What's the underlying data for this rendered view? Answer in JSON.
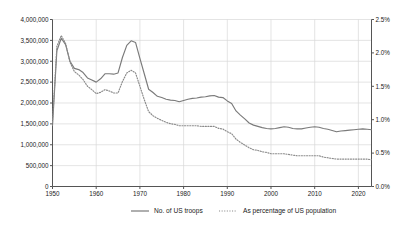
{
  "chart_data": {
    "type": "line",
    "title": "",
    "subtitle": "",
    "xlabel": "",
    "ylabel": "",
    "y2label": "",
    "xlim": [
      1950,
      2023
    ],
    "ylim": [
      0,
      4000000
    ],
    "y2lim": [
      0,
      0.025
    ],
    "grid": true,
    "legend_position": "bottom",
    "x_ticks": [
      "1950",
      "1960",
      "1970",
      "1980",
      "1990",
      "2000",
      "2010",
      "2020"
    ],
    "x_tick_values": [
      1950,
      1960,
      1970,
      1980,
      1990,
      2000,
      2010,
      2020
    ],
    "y_ticks": [
      "0",
      "500,000",
      "1,000,000",
      "1,500,000",
      "2,000,000",
      "2,500,000",
      "3,000,000",
      "3,500,000",
      "4,000,000"
    ],
    "y_tick_values": [
      0,
      500000,
      1000000,
      1500000,
      2000000,
      2500000,
      3000000,
      3500000,
      4000000
    ],
    "y2_ticks": [
      "0.0%",
      "0.5%",
      "1.0%",
      "1.5%",
      "2.0%",
      "2.5%"
    ],
    "y2_tick_values": [
      0,
      0.005,
      0.01,
      0.015,
      0.02,
      0.025
    ],
    "x": [
      1950,
      1951,
      1952,
      1953,
      1954,
      1955,
      1956,
      1957,
      1958,
      1959,
      1960,
      1961,
      1962,
      1963,
      1964,
      1965,
      1966,
      1967,
      1968,
      1969,
      1970,
      1971,
      1972,
      1973,
      1974,
      1975,
      1976,
      1977,
      1978,
      1979,
      1980,
      1981,
      1982,
      1983,
      1984,
      1985,
      1986,
      1987,
      1988,
      1989,
      1990,
      1991,
      1992,
      1993,
      1994,
      1995,
      1996,
      1997,
      1998,
      1999,
      2000,
      2001,
      2002,
      2003,
      2004,
      2005,
      2006,
      2007,
      2008,
      2009,
      2010,
      2011,
      2012,
      2013,
      2014,
      2015,
      2016,
      2017,
      2018,
      2019,
      2020,
      2021,
      2022,
      2023
    ],
    "series": [
      {
        "name": "No. of US troops",
        "axis": "left",
        "style": "solid",
        "color": "#7a7a7a",
        "values": [
          1460000,
          3250000,
          3550000,
          3400000,
          3000000,
          2830000,
          2800000,
          2730000,
          2600000,
          2550000,
          2500000,
          2580000,
          2700000,
          2700000,
          2690000,
          2720000,
          3090000,
          3380000,
          3490000,
          3450000,
          3070000,
          2700000,
          2330000,
          2250000,
          2160000,
          2130000,
          2090000,
          2070000,
          2060000,
          2030000,
          2060000,
          2090000,
          2110000,
          2120000,
          2140000,
          2150000,
          2170000,
          2180000,
          2140000,
          2130000,
          2050000,
          1990000,
          1810000,
          1710000,
          1620000,
          1520000,
          1470000,
          1440000,
          1410000,
          1390000,
          1380000,
          1390000,
          1410000,
          1430000,
          1420000,
          1390000,
          1380000,
          1380000,
          1400000,
          1420000,
          1430000,
          1420000,
          1390000,
          1370000,
          1340000,
          1310000,
          1330000,
          1340000,
          1350000,
          1360000,
          1370000,
          1380000,
          1370000,
          1360000
        ]
      },
      {
        "name": "As percentage of US population",
        "axis": "right",
        "style": "dotted",
        "color": "#8a8a8a",
        "values": [
          0.0096,
          0.021,
          0.0226,
          0.0214,
          0.0186,
          0.0172,
          0.0167,
          0.016,
          0.015,
          0.0145,
          0.0139,
          0.0141,
          0.0145,
          0.0143,
          0.014,
          0.014,
          0.0157,
          0.017,
          0.0174,
          0.017,
          0.015,
          0.013,
          0.0112,
          0.0106,
          0.0102,
          0.0099,
          0.0096,
          0.0094,
          0.0093,
          0.0091,
          0.0091,
          0.0091,
          0.0091,
          0.0091,
          0.009,
          0.009,
          0.009,
          0.009,
          0.0087,
          0.0086,
          0.0082,
          0.0079,
          0.0071,
          0.0066,
          0.0062,
          0.0058,
          0.0055,
          0.0054,
          0.0052,
          0.0051,
          0.0049,
          0.0049,
          0.0049,
          0.0049,
          0.0048,
          0.0047,
          0.0046,
          0.0046,
          0.0046,
          0.0046,
          0.0046,
          0.0046,
          0.0044,
          0.0043,
          0.0042,
          0.0041,
          0.0041,
          0.0041,
          0.0041,
          0.0041,
          0.0041,
          0.0041,
          0.0041,
          0.004
        ]
      }
    ],
    "legend": [
      {
        "label": "No. of US troops",
        "style": "solid"
      },
      {
        "label": "As percentage of US population",
        "style": "dotted"
      }
    ]
  },
  "colors": {
    "axis": "#555555",
    "grid": "#d8d8d8",
    "text": "#1a1a1a",
    "series_solid": "#7a7a7a",
    "series_dotted": "#8a8a8a",
    "background": "#ffffff"
  }
}
